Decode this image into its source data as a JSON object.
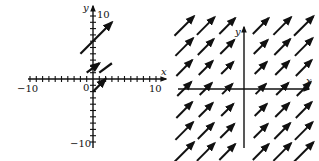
{
  "left_plot": {
    "x_axis_label": "x",
    "y_axis_label": "y",
    "origin_label": "0",
    "x_min_label": "−10",
    "x_max_label": "10",
    "y_max_label": "10",
    "y_min_label": "−10",
    "range": {
      "x": [
        -10,
        10
      ],
      "y": [
        -10,
        10
      ]
    },
    "tick_step": 2,
    "vectors": [
      {
        "from": [
          -2,
          4
        ],
        "to": [
          3,
          9
        ],
        "arrow": true
      },
      {
        "from": [
          -1,
          1
        ],
        "to": [
          1,
          2.5
        ],
        "arrow": true
      },
      {
        "from": [
          1,
          1
        ],
        "to": [
          3,
          2.5
        ],
        "arrow": false
      },
      {
        "from": [
          0,
          -2
        ],
        "to": [
          2,
          0
        ],
        "arrow": true
      }
    ]
  },
  "right_plot": {
    "x_axis_label": "x",
    "y_axis_label": "y",
    "description": "direction field with all vectors pointing up-right at 45 degrees",
    "grid": {
      "cols": [
        -3,
        -2,
        -1,
        1,
        2,
        3
      ],
      "rows": [
        3,
        2,
        1,
        0,
        -1,
        -2,
        -3
      ]
    }
  },
  "colors": {
    "ink": "#111111",
    "background": "#ffffff"
  }
}
